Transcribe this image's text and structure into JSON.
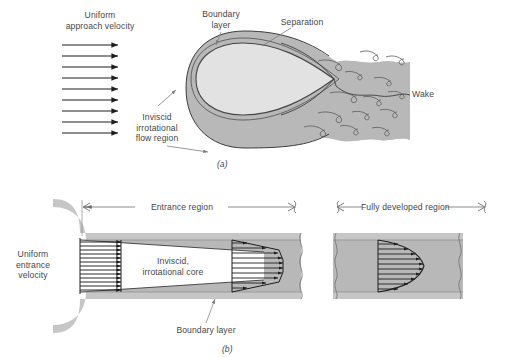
{
  "figure": {
    "panels": [
      {
        "id": "(a)",
        "name": "flow-over-a-body",
        "labels": {
          "uniform_approach_velocity": "Uniform\napproach velocity",
          "boundary_layer": "Boundary\nlayer",
          "separation": "Separation",
          "inviscid_irrotational_flow_region": "Inviscid\nirrotational\nflow region",
          "wake": "Wake"
        },
        "approach_arrow_count": 9,
        "eddy_count": 14
      },
      {
        "id": "(b)",
        "name": "entrance-and-fully-developed-pipe-flow",
        "labels": {
          "entrance_region": "Entrance region",
          "fully_developed_region": "Fully developed region",
          "uniform_entrance_velocity": "Uniform\nentrance\nvelocity",
          "inviscid_irrotational_core": "Inviscid,\nirrotational core",
          "boundary_layer": "Boundary layer"
        },
        "inlet_profile_arrow_count": 13,
        "developing_profile_arrow_count": 11,
        "developed_profile_arrow_count": 11
      }
    ],
    "colors": {
      "viscous_fill": "#b8b8b8",
      "inviscid_fill": "#e6e6e6",
      "wall_fill": "#c6c6c6",
      "line": "#2b2b2b",
      "leader": "#8a8a8a",
      "text": "#474747",
      "background": "#ffffff"
    }
  }
}
